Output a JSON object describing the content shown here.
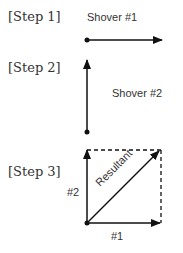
{
  "steps": [
    {
      "label": "[Step 1]",
      "vector_label": "Shover #1"
    },
    {
      "label": "[Step 2]",
      "vector_label": "Shover #2"
    },
    {
      "label": "[Step 3]",
      "labels": {
        "vertical": "#2",
        "horizontal": "#1",
        "diagonal": "Resultant"
      }
    }
  ],
  "colors": {
    "ink": "#111111",
    "text": "#333333"
  }
}
